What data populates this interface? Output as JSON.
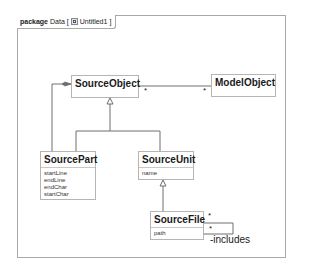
{
  "frame": {
    "keyword": "package",
    "name": "Data",
    "diagram_icon": "class-diagram-icon",
    "diagram_name": "Untitled1"
  },
  "classes": {
    "source_object": {
      "name": "SourceObject"
    },
    "model_object": {
      "name": "ModelObject"
    },
    "source_part": {
      "name": "SourcePart",
      "attributes": [
        "startLine",
        "endLine",
        "endChar",
        "startChar"
      ]
    },
    "source_unit": {
      "name": "SourceUnit",
      "attributes": [
        "name"
      ]
    },
    "source_file": {
      "name": "SourceFile",
      "attributes": [
        "path"
      ]
    }
  },
  "associations": {
    "source_to_model": {
      "source_multiplicity": "*",
      "target_multiplicity": "*"
    },
    "includes": {
      "multiplicity_a": "*",
      "multiplicity_b": "*",
      "role": "-includes"
    }
  },
  "colors": {
    "border": "#a9a9a9",
    "line": "#6e6e6e",
    "text": "#1a1a1a"
  }
}
